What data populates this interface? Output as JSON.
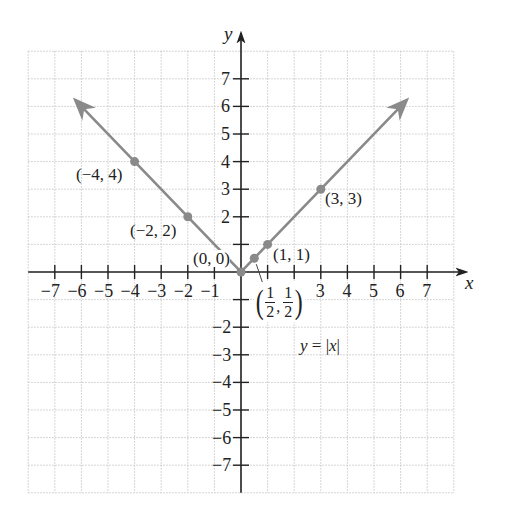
{
  "chart_data": {
    "type": "line",
    "title": "",
    "equation_label": "y = |x|",
    "xlabel": "x",
    "ylabel": "y",
    "xlim": [
      -8,
      8
    ],
    "ylim": [
      -8,
      8
    ],
    "grid": true,
    "x_ticks": [
      -7,
      -6,
      -5,
      -4,
      -3,
      -2,
      -1,
      1,
      2,
      3,
      4,
      5,
      6,
      7
    ],
    "x_tick_labels": [
      "−7",
      "−6",
      "−5",
      "−4",
      "−3",
      "−2",
      "−1",
      "3",
      "4",
      "5",
      "6",
      "7"
    ],
    "y_ticks": [
      -7,
      -6,
      -5,
      -4,
      -3,
      -2,
      -1,
      1,
      2,
      3,
      4,
      5,
      6,
      7
    ],
    "y_tick_labels": [
      "7",
      "6",
      "5",
      "4",
      "3",
      "2",
      "−2",
      "−3",
      "−4",
      "−5",
      "−6",
      "−7"
    ],
    "series": [
      {
        "name": "y = |x|",
        "color": "#8a8a8a",
        "x": [
          -6.2,
          0,
          6.2
        ],
        "y": [
          6.2,
          0,
          6.2
        ],
        "arrows": "both ends"
      }
    ],
    "points": [
      {
        "x": -4,
        "y": 4,
        "label": "(−4, 4)"
      },
      {
        "x": -2,
        "y": 2,
        "label": "(−2, 2)"
      },
      {
        "x": 0,
        "y": 0,
        "label": "(0, 0)"
      },
      {
        "x": 0.5,
        "y": 0.5,
        "label": "(1/2, 1/2)"
      },
      {
        "x": 1,
        "y": 1,
        "label": "(1, 1)"
      },
      {
        "x": 3,
        "y": 3,
        "label": "(3, 3)"
      }
    ]
  },
  "labels": {
    "x_axis": "x",
    "y_axis": "y",
    "equation_lhs": "y",
    "equation_eq": " = |",
    "equation_var": "x",
    "equation_end": "|",
    "pt_m4": "(−4, 4)",
    "pt_m2": "(−2, 2)",
    "pt_0": "(0, 0)",
    "pt_1": "(1, 1)",
    "pt_3": "(3, 3)",
    "half_num": "1",
    "half_den": "2",
    "paren_open": "(",
    "paren_close": ")",
    "comma": ","
  }
}
